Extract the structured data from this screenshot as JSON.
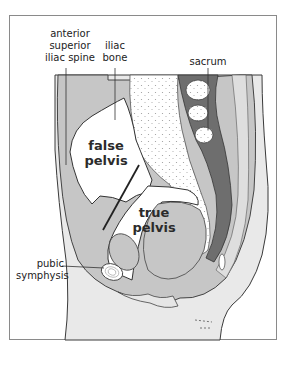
{
  "diagram": {
    "labels": {
      "anterior_superior_iliac_spine": [
        "anterior",
        "superior",
        "iliac spine"
      ],
      "iliac_bone": [
        "iliac",
        "bone"
      ],
      "sacrum": "sacrum",
      "false_pelvis": [
        "false",
        "pelvis"
      ],
      "true_pelvis": [
        "true",
        "pelvis"
      ],
      "pubic_symphysis": [
        "pubic",
        "symphysis"
      ]
    },
    "colors": {
      "frame_border": "#8a8a8a",
      "soft_tissue_light": "#e6e6e6",
      "soft_tissue_mid": "#c4c4c4",
      "dark_structure": "#6e6e6e",
      "bone_white": "#ffffff",
      "outline": "#3a3a3a"
    }
  }
}
